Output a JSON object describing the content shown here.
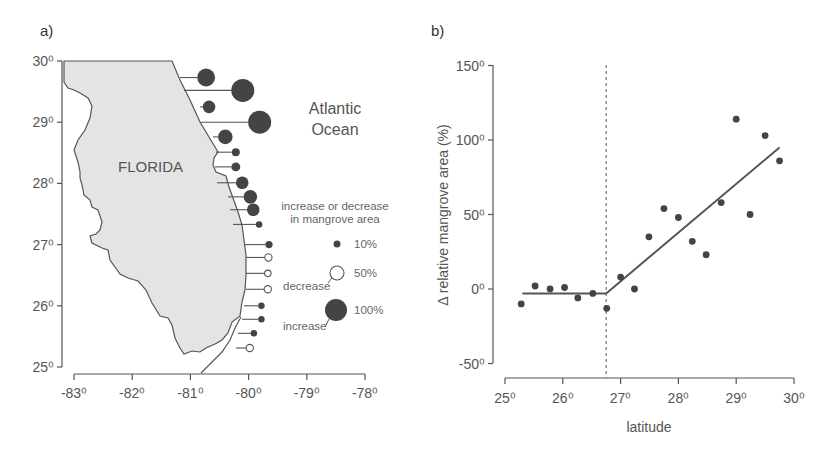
{
  "panel_a": {
    "label": "a)",
    "state_label": "FLORIDA",
    "ocean_label_line1": "Atlantic",
    "ocean_label_line2": "Ocean",
    "y_ticks": [
      "30⁰",
      "29⁰",
      "28⁰",
      "27⁰",
      "26⁰",
      "25⁰"
    ],
    "x_ticks": [
      "-83⁰",
      "-82⁰",
      "-81⁰",
      "-80⁰",
      "-79⁰",
      "-78⁰"
    ],
    "legend": {
      "title_line1": "increase or decrease",
      "title_line2": "in mangrove area",
      "items": [
        {
          "label": "10%",
          "type": "increase"
        },
        {
          "label": "50%",
          "type": "decrease"
        },
        {
          "label": "100%",
          "type": "increase"
        }
      ],
      "decrease_label": "decrease",
      "increase_label": "increase"
    }
  },
  "panel_b": {
    "label": "b)",
    "xlabel": "latitude",
    "ylabel": "Δ relative mangrove area (%)",
    "y_ticks": [
      "150⁰",
      "100⁰",
      "50⁰",
      "0⁰",
      "-50⁰"
    ],
    "x_ticks": [
      "25⁰",
      "26⁰",
      "27⁰",
      "28⁰",
      "29⁰",
      "30⁰"
    ]
  },
  "colors": {
    "land": "#e4e4e4",
    "outline": "#555555",
    "marker": "#444444",
    "text": "#555555"
  },
  "chart_data": [
    {
      "type": "map",
      "title": "a)",
      "description": "Florida map with bubble markers along Atlantic coast showing change in mangrove area",
      "xlabel": "longitude",
      "ylabel": "latitude",
      "xlim": [
        -83,
        -78
      ],
      "ylim": [
        25,
        30
      ],
      "x_ticks": [
        -83,
        -82,
        -81,
        -80,
        -79,
        -78
      ],
      "y_ticks": [
        25,
        26,
        27,
        28,
        29,
        30
      ],
      "legend": [
        {
          "label": "10%",
          "kind": "increase (filled)"
        },
        {
          "label": "50%",
          "kind": "decrease (open)"
        },
        {
          "label": "100%",
          "kind": "increase (filled)"
        }
      ],
      "markers": [
        {
          "lat": 29.73,
          "lon": -80.73,
          "pct": 60,
          "dir": "increase"
        },
        {
          "lat": 29.52,
          "lon": -80.1,
          "pct": 100,
          "dir": "increase"
        },
        {
          "lat": 29.25,
          "lon": -80.68,
          "pct": 30,
          "dir": "increase"
        },
        {
          "lat": 29.0,
          "lon": -79.81,
          "pct": 100,
          "dir": "increase"
        },
        {
          "lat": 28.76,
          "lon": -80.4,
          "pct": 40,
          "dir": "increase"
        },
        {
          "lat": 28.51,
          "lon": -80.22,
          "pct": 12,
          "dir": "increase"
        },
        {
          "lat": 28.27,
          "lon": -80.22,
          "pct": 15,
          "dir": "increase"
        },
        {
          "lat": 28.01,
          "lon": -80.11,
          "pct": 30,
          "dir": "increase"
        },
        {
          "lat": 27.78,
          "lon": -79.97,
          "pct": 35,
          "dir": "increase"
        },
        {
          "lat": 27.57,
          "lon": -79.92,
          "pct": 30,
          "dir": "increase"
        },
        {
          "lat": 27.33,
          "lon": -79.82,
          "pct": 8,
          "dir": "increase"
        },
        {
          "lat": 27.0,
          "lon": -79.65,
          "pct": 10,
          "dir": "increase"
        },
        {
          "lat": 26.79,
          "lon": -79.66,
          "pct": 10,
          "dir": "decrease"
        },
        {
          "lat": 26.53,
          "lon": -79.67,
          "pct": 8,
          "dir": "decrease"
        },
        {
          "lat": 26.27,
          "lon": -79.67,
          "pct": 10,
          "dir": "decrease"
        },
        {
          "lat": 26.0,
          "lon": -79.78,
          "pct": 8,
          "dir": "increase"
        },
        {
          "lat": 25.78,
          "lon": -79.78,
          "pct": 8,
          "dir": "increase"
        },
        {
          "lat": 25.55,
          "lon": -79.91,
          "pct": 8,
          "dir": "increase"
        },
        {
          "lat": 25.31,
          "lon": -79.98,
          "pct": 10,
          "dir": "decrease"
        }
      ]
    },
    {
      "type": "scatter",
      "title": "b)",
      "xlabel": "latitude",
      "ylabel": "Δ relative mangrove area (%)",
      "xlim": [
        25,
        30
      ],
      "ylim": [
        -50,
        150
      ],
      "x_ticks": [
        25,
        26,
        27,
        28,
        29,
        30
      ],
      "y_ticks": [
        -50,
        0,
        50,
        100,
        150
      ],
      "grid": false,
      "x": [
        25.28,
        25.52,
        25.78,
        26.03,
        26.26,
        26.52,
        26.76,
        27.0,
        27.24,
        27.49,
        27.75,
        28.0,
        28.24,
        28.48,
        28.74,
        29.0,
        29.24,
        29.5,
        29.75
      ],
      "y": [
        -10,
        2,
        0,
        1,
        -6,
        -3,
        -13,
        8,
        0,
        35,
        54,
        48,
        32,
        23,
        58,
        114,
        50,
        103,
        86
      ],
      "fit_line": {
        "type": "piecewise-linear",
        "points": [
          [
            25.3,
            -3
          ],
          [
            26.75,
            -3
          ],
          [
            29.75,
            95
          ]
        ]
      },
      "threshold_line": {
        "x": 26.75,
        "style": "dashed"
      }
    }
  ]
}
